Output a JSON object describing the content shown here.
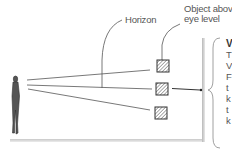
{
  "diagram": {
    "labels": {
      "horizon": "Horizon",
      "object_above_line1": "Object above",
      "object_above_line2": "eye level"
    },
    "side_text": {
      "heading": "V",
      "lines": [
        "T",
        "V",
        "F",
        "t",
        "k",
        "t",
        "k"
      ]
    },
    "elements": {
      "viewer": "standing person figure",
      "sight_lines": 3,
      "objects": [
        "above eye level",
        "at eye level",
        "below eye level"
      ]
    },
    "colors": {
      "line": "#444444",
      "text": "#555555",
      "hatch": "#555555"
    }
  }
}
